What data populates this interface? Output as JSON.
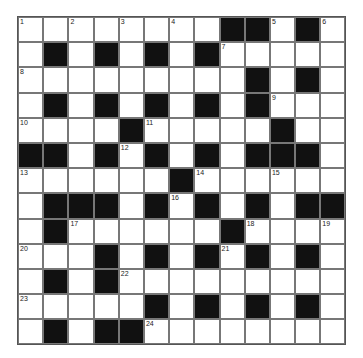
{
  "puzzle": {
    "rows": [
      "........##.#.",
      ".#.#.#.#.....",
      ".........#.#.",
      ".#.#.#.#.#...",
      "....#.....#..",
      "##.#.#.#.###.",
      "......#......",
      ".###.#.#.#.##",
      ".#......#....",
      "...#.#.#.#.#.",
      ".#.#.........",
      ".....#.#.#.#.",
      ".#.##........"
    ],
    "numbers": {
      "0,0": "1",
      "0,2": "2",
      "0,4": "3",
      "0,6": "4",
      "0,10": "5",
      "0,12": "6",
      "1,8": "7",
      "2,0": "8",
      "3,10": "9",
      "4,0": "10",
      "4,5": "11",
      "5,4": "12",
      "6,0": "13",
      "6,7": "14",
      "6,10": "15",
      "7,6": "16",
      "8,2": "17",
      "8,9": "18",
      "8,12": "19",
      "9,0": "20",
      "9,8": "21",
      "10,4": "22",
      "11,0": "23",
      "12,5": "24"
    }
  }
}
